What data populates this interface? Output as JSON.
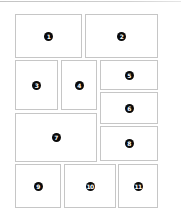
{
  "layout": {
    "title": "Numbered panel grid layout",
    "border_color": "#c6c6c6",
    "badge_color": "#0a0a0a",
    "panels": [
      {
        "id": 1,
        "label": "1",
        "x": 15,
        "y": 14,
        "w": 67,
        "h": 44
      },
      {
        "id": 2,
        "label": "2",
        "x": 85,
        "y": 14,
        "w": 73,
        "h": 44
      },
      {
        "id": 3,
        "label": "3",
        "x": 15,
        "y": 60,
        "w": 43,
        "h": 50
      },
      {
        "id": 4,
        "label": "4",
        "x": 61,
        "y": 60,
        "w": 36,
        "h": 50
      },
      {
        "id": 5,
        "label": "5",
        "x": 100,
        "y": 60,
        "w": 58,
        "h": 30
      },
      {
        "id": 6,
        "label": "6",
        "x": 100,
        "y": 92,
        "w": 58,
        "h": 32
      },
      {
        "id": 7,
        "label": "7",
        "x": 15,
        "y": 113,
        "w": 82,
        "h": 49
      },
      {
        "id": 8,
        "label": "8",
        "x": 100,
        "y": 126,
        "w": 58,
        "h": 35
      },
      {
        "id": 9,
        "label": "9",
        "x": 15,
        "y": 164,
        "w": 46,
        "h": 44
      },
      {
        "id": 10,
        "label": "10",
        "x": 64,
        "y": 164,
        "w": 52,
        "h": 44
      },
      {
        "id": 11,
        "label": "11",
        "x": 118,
        "y": 164,
        "w": 40,
        "h": 44
      }
    ]
  }
}
